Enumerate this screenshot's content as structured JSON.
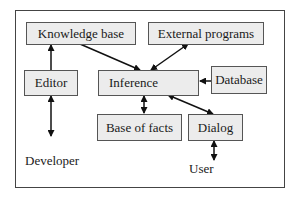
{
  "diagram": {
    "nodes": [
      {
        "id": "knowledge_base",
        "label": "Knowledge base"
      },
      {
        "id": "external_programs",
        "label": "External programs"
      },
      {
        "id": "editor",
        "label": "Editor"
      },
      {
        "id": "inference",
        "label": "Inference"
      },
      {
        "id": "database",
        "label": "Database"
      },
      {
        "id": "base_of_facts",
        "label": "Base of facts"
      },
      {
        "id": "dialog",
        "label": "Dialog"
      }
    ],
    "actors": [
      {
        "id": "developer",
        "label": "Developer"
      },
      {
        "id": "user",
        "label": "User"
      }
    ],
    "edges": [
      {
        "from": "editor",
        "to": "knowledge_base",
        "direction": "forward"
      },
      {
        "from": "knowledge_base",
        "to": "inference",
        "direction": "forward"
      },
      {
        "from": "external_programs",
        "to": "inference",
        "direction": "both"
      },
      {
        "from": "database",
        "to": "inference",
        "direction": "forward"
      },
      {
        "from": "inference",
        "to": "base_of_facts",
        "direction": "both"
      },
      {
        "from": "inference",
        "to": "dialog",
        "direction": "both"
      },
      {
        "from": "developer",
        "to": "editor",
        "direction": "both"
      },
      {
        "from": "dialog",
        "to": "user",
        "direction": "both"
      }
    ]
  }
}
